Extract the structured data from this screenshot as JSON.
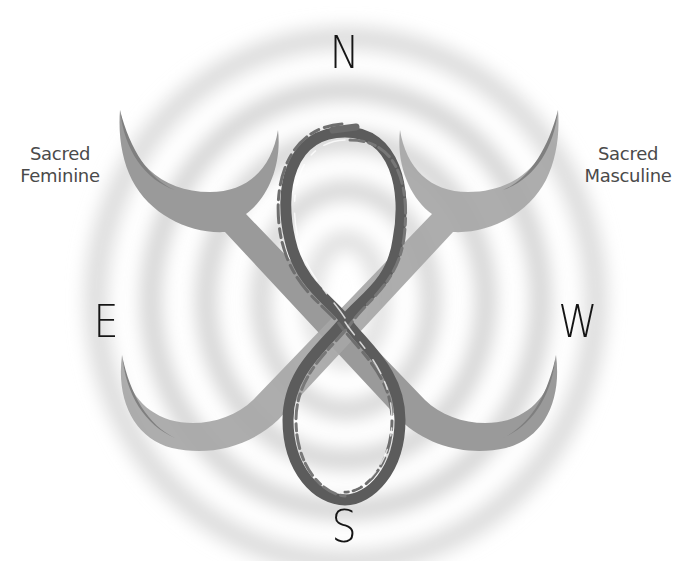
{
  "diagram": {
    "directions": {
      "north": "N",
      "east": "E",
      "west": "W",
      "south": "S"
    },
    "labels": {
      "left": {
        "line1": "Sacred",
        "line2": "Feminine"
      },
      "right": {
        "line1": "Sacred",
        "line2": "Masculine"
      }
    },
    "symbols": {
      "center": "infinity-figure-eight-icon",
      "crossed_crescents": "crossed-crescents-icon",
      "background": "concentric-rings"
    },
    "colors": {
      "background": "#ffffff",
      "rings": "#d6d6d6",
      "crescent_dark": "#8a8a8a",
      "crescent_light": "#b4b4b4",
      "infinity_stroke": "#5a5a5a",
      "text_direction": "#151515",
      "text_label": "#4a4a4a"
    }
  }
}
